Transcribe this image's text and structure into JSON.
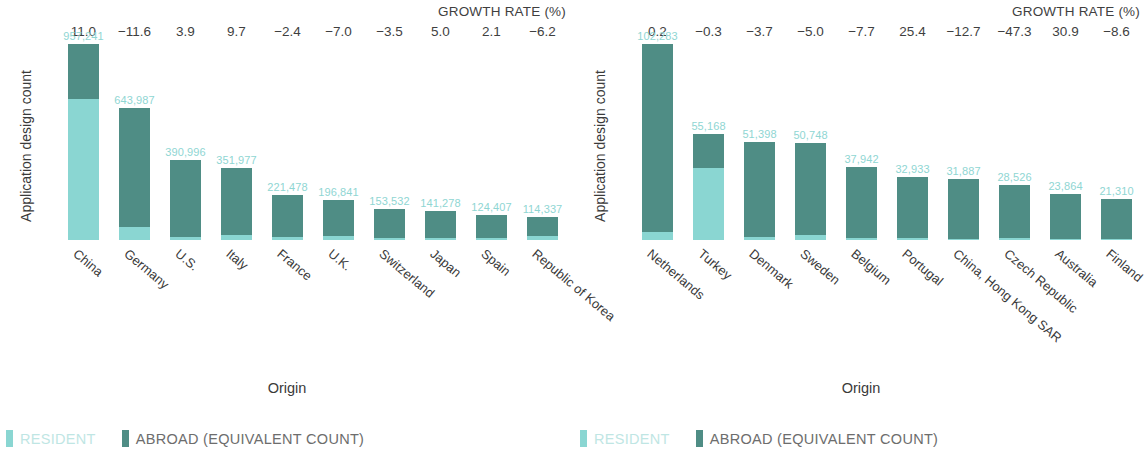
{
  "colors": {
    "resident": "#8ad6d2",
    "abroad": "#4f8d85",
    "value_label": "#8fd6d3",
    "text": "#3a3a3a"
  },
  "legend": {
    "resident_label": "RESIDENT",
    "abroad_label": "ABROAD (EQUIVALENT COUNT)"
  },
  "chart_data": [
    {
      "type": "bar",
      "title": "",
      "growth_header": "GROWTH RATE (%)",
      "xlabel": "Origin",
      "ylabel": "Application design count",
      "ylim": [
        0,
        957241
      ],
      "grid": false,
      "legend_position": "bottom-left",
      "stacked": true,
      "categories": [
        "China",
        "Germany",
        "U.S.",
        "Italy",
        "France",
        "U.K.",
        "Switzerland",
        "Japan",
        "Spain",
        "Republic of Korea"
      ],
      "values": [
        957241,
        643987,
        390996,
        351977,
        221478,
        196841,
        153532,
        141278,
        124407,
        114337
      ],
      "value_labels": [
        "957,241",
        "643,987",
        "390,996",
        "351,977",
        "221,478",
        "196,841",
        "153,532",
        "141,278",
        "124,407",
        "114,337"
      ],
      "growth_rates": [
        "11.0",
        "−11.6",
        "3.9",
        "9.7",
        "−2.4",
        "−7.0",
        "−3.5",
        "5.0",
        "2.1",
        "−6.2"
      ],
      "series": [
        {
          "name": "RESIDENT",
          "values": [
            689214,
            64399,
            15640,
            24638,
            13289,
            19684,
            7677,
            9889,
            8708,
            20581
          ]
        },
        {
          "name": "ABROAD (EQUIVALENT COUNT)",
          "values": [
            268027,
            579588,
            375356,
            327339,
            208189,
            177157,
            145855,
            131389,
            115699,
            93756
          ]
        }
      ]
    },
    {
      "type": "bar",
      "title": "",
      "growth_header": "GROWTH RATE (%)",
      "xlabel": "Origin",
      "ylabel": "Application design count",
      "ylim": [
        0,
        102283
      ],
      "grid": false,
      "legend_position": "bottom-left",
      "stacked": true,
      "categories": [
        "Netherlands",
        "Turkey",
        "Denmark",
        "Sweden",
        "Belgium",
        "Portugal",
        "China, Hong Kong SAR",
        "Czech Republic",
        "Australia",
        "Finland"
      ],
      "values": [
        102283,
        55168,
        51398,
        50748,
        37942,
        32933,
        31887,
        28526,
        23864,
        21310
      ],
      "value_labels": [
        "102,283",
        "55,168",
        "51,398",
        "50,748",
        "37,942",
        "32,933",
        "31,887",
        "28,526",
        "23,864",
        "21,310"
      ],
      "growth_rates": [
        "0.2",
        "−0.3",
        "−3.7",
        "−5.0",
        "−7.7",
        "25.4",
        "−12.7",
        "−47.3",
        "30.9",
        "−8.6"
      ],
      "series": [
        {
          "name": "RESIDENT",
          "values": [
            4091,
            37514,
            1542,
            2537,
            1138,
            988,
            638,
            856,
            716,
            639
          ]
        },
        {
          "name": "ABROAD (EQUIVALENT COUNT)",
          "values": [
            98192,
            17654,
            49856,
            48211,
            36804,
            31945,
            31249,
            27670,
            23148,
            20671
          ]
        }
      ]
    }
  ]
}
